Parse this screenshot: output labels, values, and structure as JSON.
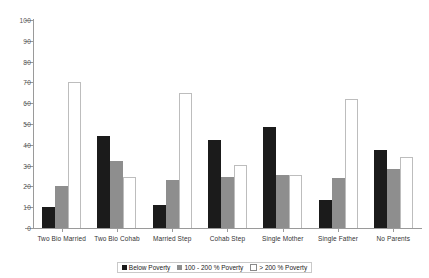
{
  "chart_data": {
    "type": "bar",
    "title": "",
    "xlabel": "",
    "ylabel": "",
    "ylim": [
      0,
      100
    ],
    "yticks": [
      0,
      10,
      20,
      30,
      40,
      50,
      60,
      70,
      80,
      90,
      100
    ],
    "grid": false,
    "legend_position": "bottom",
    "categories": [
      "Two Bio Married",
      "Two Bio Cohab",
      "Married Step",
      "Cohab Step",
      "Single Mother",
      "Single Father",
      "No Parents"
    ],
    "series": [
      {
        "name": "Below Poverty",
        "color": "#1b1b1b",
        "values": [
          10,
          44,
          11,
          42.5,
          48.5,
          13.5,
          37.5
        ]
      },
      {
        "name": "100 - 200 % Poverty",
        "color": "#8e8e8e",
        "values": [
          20,
          32,
          23,
          24.5,
          25.5,
          24,
          28.5
        ]
      },
      {
        "name": "> 200 % Poverty",
        "color": "#ffffff",
        "values": [
          70,
          24.5,
          65,
          30.5,
          25.5,
          62,
          34
        ]
      }
    ]
  },
  "legend": {
    "items": [
      {
        "label": "Below Poverty"
      },
      {
        "label": "100 - 200 % Poverty"
      },
      {
        "label": "> 200 % Poverty"
      }
    ]
  }
}
